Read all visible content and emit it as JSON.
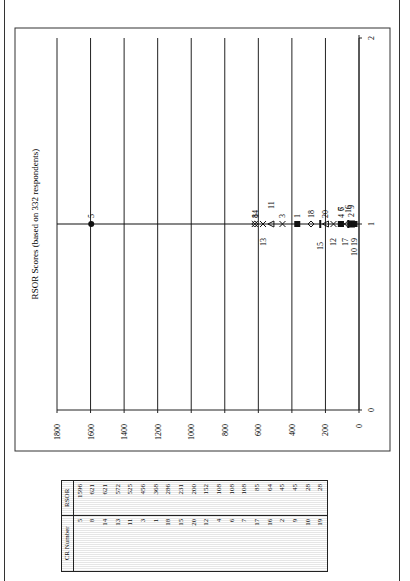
{
  "chart_data": {
    "type": "scatter",
    "title": "RSOR Scores (based on 332 respondents)",
    "xlabel": "",
    "ylabel": "",
    "xlim": [
      0,
      2
    ],
    "ylim": [
      0,
      1800
    ],
    "x_ticks": [
      "0",
      "1",
      "2"
    ],
    "y_ticks": [
      "0",
      "200",
      "400",
      "600",
      "800",
      "1000",
      "1200",
      "1400",
      "1600",
      "1800"
    ],
    "grid": true,
    "orientation": "rotated 90 degrees on page",
    "series": [
      {
        "name": "5",
        "x": 1,
        "y": 1596,
        "marker": "circle-filled"
      },
      {
        "name": "8",
        "x": 1,
        "y": 621,
        "marker": "diamond"
      },
      {
        "name": "14",
        "x": 1,
        "y": 621,
        "marker": "x"
      },
      {
        "name": "13",
        "x": 1,
        "y": 572,
        "marker": "x"
      },
      {
        "name": "11",
        "x": 1,
        "y": 525,
        "marker": "triangle"
      },
      {
        "name": "3",
        "x": 1,
        "y": 456,
        "marker": "x"
      },
      {
        "name": "1",
        "x": 1,
        "y": 368,
        "marker": "square-filled"
      },
      {
        "name": "18",
        "x": 1,
        "y": 286,
        "marker": "diamond"
      },
      {
        "name": "15",
        "x": 1,
        "y": 231,
        "marker": "bar"
      },
      {
        "name": "20",
        "x": 1,
        "y": 200,
        "marker": "triangle"
      },
      {
        "name": "12",
        "x": 1,
        "y": 152,
        "marker": "x"
      },
      {
        "name": "4",
        "x": 1,
        "y": 108,
        "marker": "x"
      },
      {
        "name": "6",
        "x": 1,
        "y": 108,
        "marker": "square-filled"
      },
      {
        "name": "7",
        "x": 1,
        "y": 108,
        "marker": "star"
      },
      {
        "name": "17",
        "x": 1,
        "y": 85,
        "marker": "x"
      },
      {
        "name": "16",
        "x": 1,
        "y": 64,
        "marker": "bar"
      },
      {
        "name": "2",
        "x": 1,
        "y": 45,
        "marker": "square"
      },
      {
        "name": "9",
        "x": 1,
        "y": 45,
        "marker": "square-filled"
      },
      {
        "name": "10",
        "x": 1,
        "y": 28,
        "marker": "square-filled"
      },
      {
        "name": "19",
        "x": 1,
        "y": 28,
        "marker": "square-filled"
      }
    ]
  },
  "table": {
    "headers": [
      "CR Number",
      "RSOR"
    ],
    "rows": [
      [
        "5",
        "1596"
      ],
      [
        "8",
        "621"
      ],
      [
        "14",
        "621"
      ],
      [
        "13",
        "572"
      ],
      [
        "11",
        "525"
      ],
      [
        "3",
        "456"
      ],
      [
        "1",
        "368"
      ],
      [
        "18",
        "286"
      ],
      [
        "15",
        "231"
      ],
      [
        "20",
        "200"
      ],
      [
        "12",
        "152"
      ],
      [
        "4",
        "108"
      ],
      [
        "6",
        "108"
      ],
      [
        "7",
        "108"
      ],
      [
        "17",
        "85"
      ],
      [
        "16",
        "64"
      ],
      [
        "2",
        "45"
      ],
      [
        "9",
        "45"
      ],
      [
        "10",
        "28"
      ],
      [
        "19",
        "28"
      ]
    ]
  },
  "colors": {
    "line": "#111111",
    "grid": "#222222",
    "table_stripe": "#e6e6e6"
  }
}
